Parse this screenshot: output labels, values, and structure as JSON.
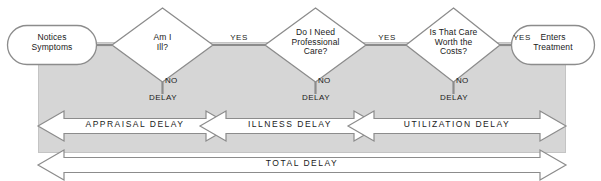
{
  "diagram": {
    "colors": {
      "panel_fill": "#d6d6d6",
      "panel_edge": "#bdbdbd",
      "shape_fill": "#ffffff",
      "stroke": "#8c8c8c",
      "text": "#1a1a1a"
    },
    "terminators": [
      {
        "id": "start",
        "label": "Notices\nSymptoms"
      },
      {
        "id": "end",
        "label": "Enters\nTreatment"
      }
    ],
    "decisions": [
      {
        "id": "d1",
        "label": "Am I\nIll?",
        "yes": "YES",
        "no": "NO",
        "no_outcome": "DELAY"
      },
      {
        "id": "d2",
        "label": "Do I Need\nProfessional\nCare?",
        "yes": "YES",
        "no": "NO",
        "no_outcome": "DELAY"
      },
      {
        "id": "d3",
        "label": "Is That Care\nWorth the\nCosts?",
        "yes": "YES",
        "no": "NO",
        "no_outcome": "DELAY"
      }
    ],
    "delay_bars": [
      {
        "id": "appraisal",
        "label": "APPRAISAL DELAY"
      },
      {
        "id": "illness",
        "label": "ILLNESS DELAY"
      },
      {
        "id": "utilization",
        "label": "UTILIZATION DELAY"
      }
    ],
    "total_bar": {
      "id": "total",
      "label": "TOTAL DELAY"
    }
  }
}
